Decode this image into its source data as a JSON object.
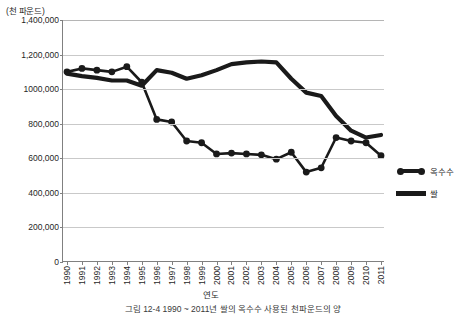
{
  "chart_data": {
    "type": "line",
    "title": "",
    "caption": "그림 12-4 1990 ~ 2011년 쌀의 옥수수 사용된 천파운드의 양",
    "unit_label": "(천 파운드)",
    "xlabel": "연도",
    "ylabel": "",
    "ylim": [
      0,
      1400000
    ],
    "ytick_values": [
      0,
      200000,
      400000,
      600000,
      800000,
      1000000,
      1200000,
      1400000
    ],
    "ytick_labels": [
      "0",
      "200,000",
      "400,000",
      "600,000",
      "800,000",
      "1000,000",
      "1,200,000",
      "1,400,000"
    ],
    "grid": true,
    "legend_position": "right",
    "categories": [
      "1990",
      "1991",
      "1992",
      "1993",
      "1994",
      "1995",
      "1996",
      "1997",
      "1998",
      "1999",
      "2000",
      "2001",
      "2002",
      "2003",
      "2004",
      "2005",
      "2006",
      "2007",
      "2008",
      "2009",
      "2010",
      "2011"
    ],
    "series": [
      {
        "name": "옥수수",
        "marker": "circle",
        "color": "#1a1a1a",
        "values": [
          1100000,
          1120000,
          1110000,
          1100000,
          1130000,
          1040000,
          825000,
          810000,
          700000,
          690000,
          625000,
          630000,
          625000,
          620000,
          595000,
          635000,
          520000,
          545000,
          720000,
          700000,
          690000,
          615000
        ]
      },
      {
        "name": "쌀",
        "marker": "none",
        "color": "#1a1a1a",
        "values": [
          1090000,
          1075000,
          1065000,
          1050000,
          1050000,
          1020000,
          1110000,
          1095000,
          1060000,
          1080000,
          1110000,
          1145000,
          1155000,
          1160000,
          1155000,
          1060000,
          980000,
          960000,
          845000,
          760000,
          720000,
          735000
        ]
      }
    ]
  },
  "legend": {
    "items": [
      {
        "label": "옥수수"
      },
      {
        "label": "쌀"
      }
    ]
  }
}
